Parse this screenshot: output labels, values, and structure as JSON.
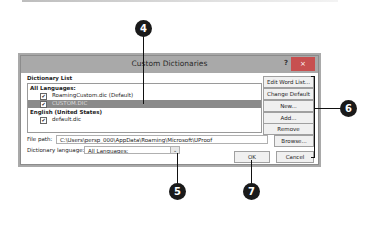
{
  "dialog": {
    "title": "Custom Dictionaries",
    "help_label": "?",
    "close_label": "×",
    "dictionary_list_label": "Dictionary List",
    "groups": [
      {
        "label": "All Languages:",
        "items": [
          {
            "name": "RoamingCustom.dic (Default)",
            "checked": true,
            "selected": false
          },
          {
            "name": "CUSTOM.DIC",
            "checked": true,
            "selected": true
          }
        ]
      },
      {
        "label": "English (United States)",
        "items": [
          {
            "name": "default.dic",
            "checked": true,
            "selected": false
          }
        ]
      }
    ],
    "buttons": {
      "edit_word_list": "Edit Word List...",
      "change_default": "Change Default",
      "new": "New...",
      "add": "Add...",
      "remove": "Remove",
      "browse": "Browse...",
      "ok": "OK",
      "cancel": "Cancel"
    },
    "file_path_label": "File path:",
    "file_path_value": "C:\\Users\\persp_000\\AppData\\Roaming\\Microsoft\\UProof",
    "dictionary_language_label": "Dictionary language:",
    "dictionary_language_value": "All Languages:",
    "check_mark": "✔",
    "dropdown_arrow": "⌄"
  },
  "callouts": {
    "c4": "4",
    "c5": "5",
    "c6": "6",
    "c7": "7"
  }
}
